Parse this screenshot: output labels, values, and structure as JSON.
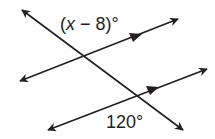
{
  "diagram": {
    "type": "parallel lines cut by a transversal",
    "stroke_color": "#231f20",
    "labels": {
      "top_angle": {
        "var": "x",
        "text_pre": "(",
        "text_post": " − 8)°"
      },
      "bottom_angle": "120°"
    },
    "lines": [
      {
        "name": "transversal",
        "from": [
          22,
          10
        ],
        "to": [
          183,
          130
        ]
      },
      {
        "name": "upper-parallel-line",
        "from": [
          20,
          81
        ],
        "to": [
          178,
          19
        ]
      },
      {
        "name": "lower-parallel-line",
        "from": [
          48,
          130
        ],
        "to": [
          207,
          69
        ]
      }
    ]
  }
}
